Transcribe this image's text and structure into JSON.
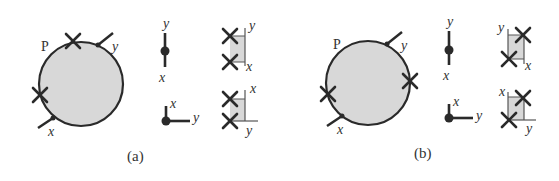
{
  "colors": {
    "ink": "#2a2a2a",
    "fill": "#d8d8d8",
    "thin_line": "#555555",
    "text": "#333333"
  },
  "panels": [
    {
      "caption": "(a)",
      "blob_label": "P",
      "blob_legs": [
        {
          "label": "y"
        },
        {
          "label": "x"
        }
      ],
      "crosses_on_blob": 2,
      "propagator_straight": {
        "top_label": "y",
        "bottom_label": "x"
      },
      "propagator_corner": {
        "up_label": "x",
        "right_label": "y"
      },
      "box_top": {
        "top_label": "y",
        "bottom_label": "x"
      },
      "box_bottom": {
        "top_label": "x",
        "bottom_label": "y"
      }
    },
    {
      "caption": "(b)",
      "blob_label": "P",
      "blob_legs": [
        {
          "label": "y"
        },
        {
          "label": "x"
        }
      ],
      "crosses_on_blob": 2,
      "propagator_straight": {
        "top_label": "y",
        "bottom_label": "x"
      },
      "propagator_corner": {
        "up_label": "x",
        "right_label": "y"
      },
      "box_top": {
        "top_label": "y",
        "bottom_label": "x"
      },
      "box_bottom": {
        "top_label": "x",
        "bottom_label": "y"
      }
    }
  ]
}
